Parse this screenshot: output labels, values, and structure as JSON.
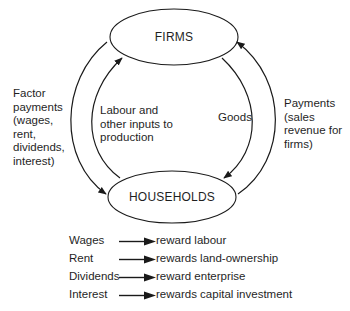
{
  "nodes": {
    "firms": "FIRMS",
    "households": "HOUSEHOLDS"
  },
  "flows": {
    "factor_payments": "Factor\npayments\n(wages,\nrent,\ndividends,\ninterest)",
    "labour_inputs": "Labour and\nother inputs to\nproduction",
    "goods": "Goods",
    "payments": "Payments\n(sales\nrevenue for\nfirms)"
  },
  "legend": [
    {
      "term": "Wages",
      "description": "reward labour"
    },
    {
      "term": "Rent",
      "description": "rewards land-ownership"
    },
    {
      "term": "Dividends",
      "description": "reward enterprise"
    },
    {
      "term": "Interest",
      "description": "rewards capital investment"
    }
  ],
  "colors": {
    "line": "#1a1a1a",
    "background": "#ffffff"
  }
}
